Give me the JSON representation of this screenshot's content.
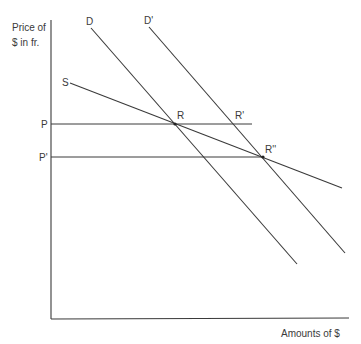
{
  "diagram": {
    "y_axis_label_line1": "Price of",
    "y_axis_label_line2": "$ in fr.",
    "x_axis_label": "Amounts of $",
    "curves": {
      "demand": "D",
      "demand_shifted": "D'",
      "supply": "S"
    },
    "price_levels": {
      "p": "P",
      "p_prime": "P'"
    },
    "points": {
      "r": "R",
      "r_prime": "R'",
      "r_double_prime": "R''"
    },
    "colors": {
      "ink": "#3a3a3a",
      "background": "#ffffff"
    }
  }
}
